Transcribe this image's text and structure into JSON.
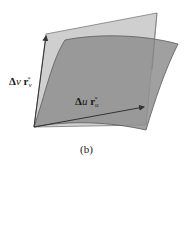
{
  "figure": {
    "caption": "(b)",
    "labels": {
      "v_vector": {
        "delta": "Δ",
        "var": "v",
        "vec": "r",
        "sub": "v",
        "sup": "*"
      },
      "u_vector": {
        "delta": "Δ",
        "var": "u",
        "vec": "r",
        "sub": "u",
        "sup": "*"
      }
    },
    "colors": {
      "tangent_plane": "#cfcfcf",
      "surface_patch": "#8f8f8f",
      "edge": "#5a5a5a",
      "arrow": "#333333"
    }
  }
}
